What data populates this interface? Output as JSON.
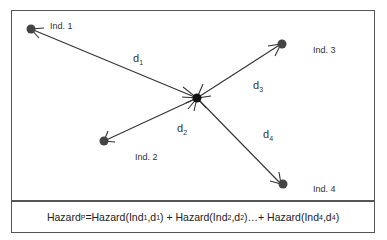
{
  "nodes": [
    {
      "id": "ind1",
      "label": "Ind. 1"
    },
    {
      "id": "ind2",
      "label": "Ind. 2"
    },
    {
      "id": "ind3",
      "label": "Ind. 3"
    },
    {
      "id": "ind4",
      "label": "Ind. 4"
    }
  ],
  "edges": [
    {
      "base": "d",
      "sub": "1"
    },
    {
      "base": "d",
      "sub": "2"
    },
    {
      "base": "d",
      "sub": "3"
    },
    {
      "base": "d",
      "sub": "4"
    }
  ],
  "formula": {
    "lhs": "Hazard",
    "lhs_sub": "P",
    "t1": " =Hazard(Ind",
    "s1": "1",
    "t1b": ",d",
    "s1b": "1",
    "t1c": ")  + Hazard(Ind",
    "s2": "2",
    "t2b": ",d",
    "s2b": "2",
    "t2c": ")…+  Hazard(Ind",
    "s4": "4",
    "t4b": ",d",
    "s4b": "4",
    "t4c": ")"
  }
}
